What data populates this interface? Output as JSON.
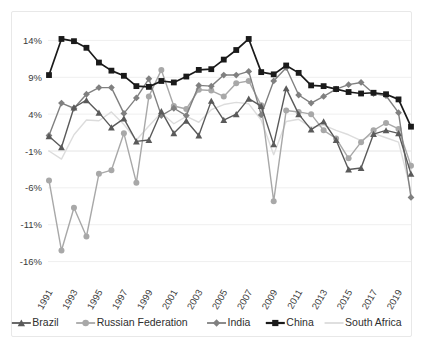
{
  "chart_data": {
    "type": "line",
    "title": "",
    "xlabel": "",
    "ylabel": "",
    "x": [
      1991,
      1992,
      1993,
      1994,
      1995,
      1996,
      1997,
      1998,
      1999,
      2000,
      2001,
      2002,
      2003,
      2004,
      2005,
      2006,
      2007,
      2008,
      2009,
      2010,
      2011,
      2012,
      2013,
      2014,
      2015,
      2016,
      2017,
      2018,
      2019,
      2020
    ],
    "xtick_labels": [
      "1991",
      "1993",
      "1995",
      "1997",
      "1999",
      "2001",
      "2003",
      "2005",
      "2007",
      "2009",
      "2011",
      "2013",
      "2015",
      "2017",
      "2019"
    ],
    "ytick_labels": [
      "14%",
      "9%",
      "4%",
      "-1%",
      "-6%",
      "-11%",
      "-16%"
    ],
    "ytick_values": [
      14,
      9,
      4,
      -1,
      -6,
      -11,
      -16
    ],
    "ylim": [
      -18.5,
      16.5
    ],
    "grid": true,
    "legend_position": "bottom",
    "series": [
      {
        "name": "Brazil",
        "color": "#5a5a5a",
        "marker": "triangle",
        "values": [
          1.0,
          -0.5,
          4.9,
          5.9,
          4.2,
          2.2,
          3.4,
          0.3,
          0.5,
          4.4,
          1.4,
          3.1,
          1.1,
          5.8,
          3.2,
          4.0,
          6.1,
          5.1,
          -0.1,
          7.5,
          4.0,
          1.9,
          3.0,
          0.5,
          -3.5,
          -3.3,
          1.3,
          1.8,
          1.4,
          -4.1
        ]
      },
      {
        "name": "Russian Federation",
        "color": "#a8a8a8",
        "marker": "circle",
        "values": [
          -5.0,
          -14.5,
          -8.7,
          -12.6,
          -4.1,
          -3.6,
          1.4,
          -5.3,
          6.4,
          10.0,
          5.1,
          4.7,
          7.3,
          7.2,
          6.4,
          8.2,
          8.5,
          5.2,
          -7.8,
          4.5,
          4.3,
          4.0,
          1.8,
          0.7,
          -2.0,
          0.2,
          1.8,
          2.8,
          2.0,
          -3.0
        ]
      },
      {
        "name": "India",
        "color": "#808080",
        "marker": "diamond",
        "values": [
          1.1,
          5.5,
          4.8,
          6.7,
          7.6,
          7.6,
          4.1,
          6.2,
          8.8,
          3.8,
          4.8,
          3.8,
          7.9,
          7.8,
          9.3,
          9.3,
          9.8,
          3.9,
          8.5,
          10.3,
          6.6,
          5.5,
          6.4,
          7.4,
          8.0,
          8.3,
          6.8,
          6.5,
          4.2,
          -7.3
        ]
      },
      {
        "name": "China",
        "color": "#1a1a1a",
        "marker": "square",
        "values": [
          9.3,
          14.2,
          13.9,
          13.0,
          11.0,
          9.9,
          9.2,
          7.8,
          7.7,
          8.5,
          8.3,
          9.1,
          10.0,
          10.1,
          11.4,
          12.7,
          14.2,
          9.7,
          9.4,
          10.6,
          9.6,
          7.9,
          7.8,
          7.4,
          7.0,
          6.8,
          6.9,
          6.7,
          6.0,
          2.3
        ]
      },
      {
        "name": "South Africa",
        "color": "#dcdcdc",
        "marker": "none",
        "values": [
          -1.0,
          -2.1,
          1.2,
          3.2,
          3.1,
          4.3,
          2.6,
          0.5,
          2.4,
          4.2,
          2.7,
          3.7,
          2.9,
          4.6,
          5.3,
          5.6,
          5.4,
          3.2,
          -1.5,
          3.0,
          3.3,
          2.2,
          2.5,
          1.8,
          1.2,
          0.4,
          1.4,
          0.8,
          0.2,
          -6.4
        ]
      }
    ]
  }
}
